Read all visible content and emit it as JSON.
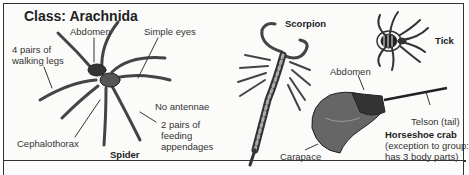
{
  "title": "Class: Arachnida",
  "spider": {
    "name": "Spider",
    "labels": {
      "legs": [
        "4 pairs of",
        "walking legs"
      ],
      "abdomen": "Abdomen",
      "eyes": "Simple eyes",
      "antennae": "No antennae",
      "appendages": [
        "2 pairs of",
        "feeding",
        "appendages"
      ],
      "cephalothorax": "Cephalothorax"
    }
  },
  "scorpion": {
    "name": "Scorpion"
  },
  "tick": {
    "name": "Tick"
  },
  "horseshoe_crab": {
    "name": "Horseshoe crab",
    "note": [
      "(exception to group:",
      "has 3 body parts)"
    ],
    "labels": {
      "abdomen": "Abdomen",
      "telson": "Telson (tail)",
      "carapace": "Carapace"
    }
  },
  "colors": {
    "border": "#333333",
    "ink": "#222222",
    "background": "#ffffff"
  }
}
